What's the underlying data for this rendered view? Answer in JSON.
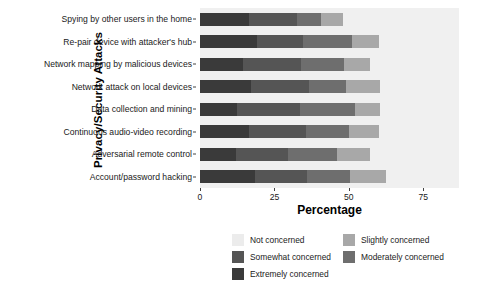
{
  "chart_data": {
    "type": "bar",
    "orientation": "horizontal",
    "stacked": true,
    "title": "",
    "xlabel": "Percentage",
    "ylabel": "Privacy/Security Attacks",
    "xlim": [
      0,
      87
    ],
    "xticks": [
      0,
      25,
      50,
      75
    ],
    "xtick_labels": [
      "0",
      "25",
      "50",
      "75"
    ],
    "grid": false,
    "legend_position": "bottom",
    "categories": [
      "Spying by other users in the home",
      "Re-pair device with attacker's hub",
      "Network mapping by malicious devices",
      "Network attack on local devices",
      "Data collection and mining",
      "Continuous audio-video recording",
      "Adversarial remote control",
      "Account/password hacking"
    ],
    "series": [
      {
        "name": "Extremely concerned",
        "color": "#3a3a3a",
        "values": [
          16.5,
          19.0,
          14.5,
          17.0,
          12.5,
          16.5,
          12.0,
          18.5
        ]
      },
      {
        "name": "Somewhat concerned",
        "color": "#555555",
        "values": [
          16.0,
          15.5,
          19.5,
          19.5,
          21.0,
          19.0,
          17.5,
          17.5
        ]
      },
      {
        "name": "Moderately concerned",
        "color": "#6e6e6e",
        "values": [
          8.0,
          16.5,
          14.5,
          12.5,
          18.5,
          14.5,
          16.5,
          14.5
        ]
      },
      {
        "name": "Slightly concerned",
        "color": "#a8a8a8",
        "values": [
          7.5,
          9.0,
          8.5,
          11.5,
          8.5,
          10.0,
          11.0,
          12.0
        ]
      },
      {
        "name": "Not concerned",
        "color": "#ececec",
        "values": [
          0.0,
          0.0,
          0.0,
          0.0,
          0.0,
          0.0,
          0.0,
          0.0
        ]
      }
    ],
    "totals": [
      48.0,
      60.0,
      57.0,
      60.5,
      60.5,
      60.0,
      57.0,
      62.5
    ]
  },
  "legend": {
    "entries": [
      {
        "label": "Not concerned",
        "color": "#ececec"
      },
      {
        "label": "Slightly concerned",
        "color": "#a8a8a8"
      },
      {
        "label": "Somewhat concerned",
        "color": "#555555"
      },
      {
        "label": "Moderately concerned",
        "color": "#6e6e6e"
      },
      {
        "label": "Extremely concerned",
        "color": "#3a3a3a"
      }
    ]
  },
  "panel": {
    "background": "#f0f0f0"
  }
}
